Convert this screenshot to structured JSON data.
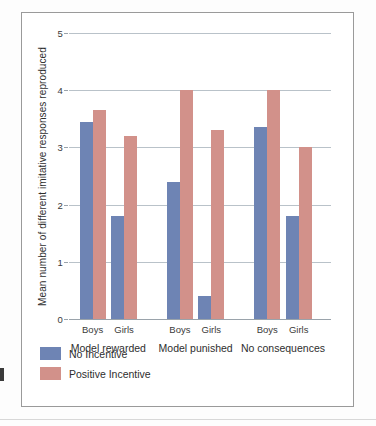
{
  "chart_data": {
    "type": "bar",
    "title": "",
    "xlabel": "",
    "ylabel": "Mean number of different imitative responses reproduced",
    "ylim": [
      0,
      5
    ],
    "yticks": [
      0,
      1,
      2,
      3,
      4,
      5
    ],
    "ytick_labels": [
      "0",
      "1",
      "2",
      "3",
      "4",
      "5"
    ],
    "grid": true,
    "legend_position": "below-left",
    "categories": [
      "Model rewarded - Boys",
      "Model rewarded - Girls",
      "Model punished - Boys",
      "Model punished - Girls",
      "No consequences - Boys",
      "No consequences - Girls"
    ],
    "groups": [
      {
        "label": "Model rewarded",
        "subcategories": [
          "Boys",
          "Girls"
        ]
      },
      {
        "label": "Model punished",
        "subcategories": [
          "Boys",
          "Girls"
        ]
      },
      {
        "label": "No consequences",
        "subcategories": [
          "Boys",
          "Girls"
        ]
      }
    ],
    "series": [
      {
        "name": "No Incentive",
        "color": "#6e84b4",
        "values": [
          3.45,
          1.8,
          2.4,
          0.4,
          3.35,
          1.8
        ]
      },
      {
        "name": "Positive Incentive",
        "color": "#d2918a",
        "values": [
          3.65,
          3.2,
          4.0,
          3.3,
          4.0,
          3.0
        ]
      }
    ]
  },
  "legend": {
    "entries": [
      {
        "label": "No Incentive"
      },
      {
        "label": "Positive Incentive"
      }
    ]
  }
}
